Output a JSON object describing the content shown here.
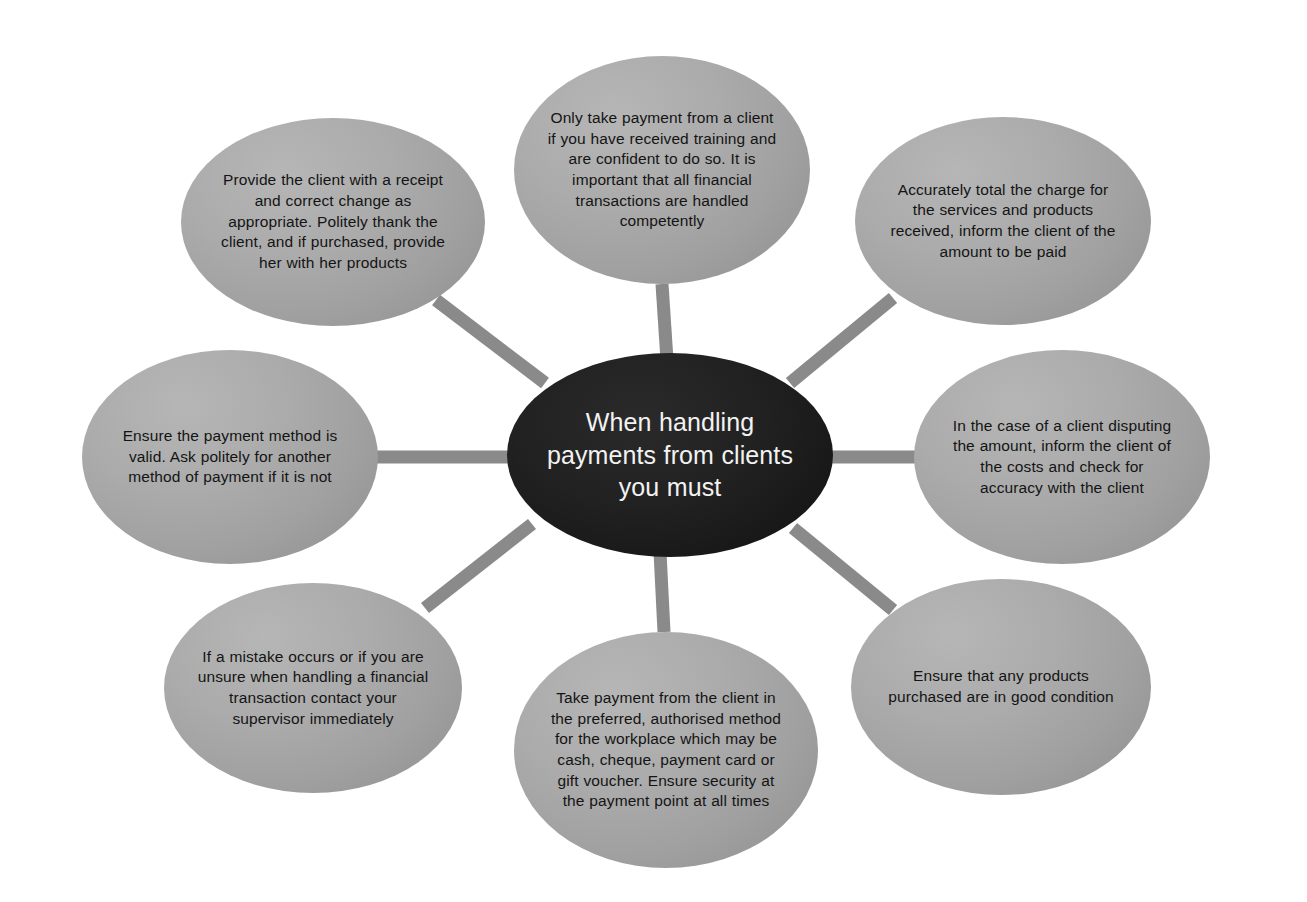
{
  "diagram": {
    "type": "hub-and-spoke",
    "title": "When handling payments from clients you must",
    "background_color": "#ffffff",
    "hub_color": "#1c1c1c",
    "hub_text_color": "#f2f2f2",
    "satellite_color": "#a5a5a5",
    "satellite_text_color": "#141414",
    "spoke_color": "#8a8a8a",
    "spoke_width_px": 13,
    "satellite_count": 8,
    "hub": {
      "label": "When handling payments from clients you must",
      "cx": 670,
      "cy": 455,
      "rx": 163,
      "ry": 102
    },
    "nodes": [
      {
        "id": "top",
        "position": "top",
        "label": "Only take payment from a client if you have received training and are confident to do so. It is important that all financial transactions are handled competently",
        "cx": 662,
        "cy": 170,
        "rx": 148,
        "ry": 114,
        "spoke": {
          "x1": 662,
          "y1": 284,
          "x2": 667,
          "y2": 360
        }
      },
      {
        "id": "top-right",
        "position": "top-right",
        "label": "Accurately total the charge for the services and products received, inform the client of the amount to be paid",
        "cx": 1003,
        "cy": 221,
        "rx": 148,
        "ry": 104,
        "spoke": {
          "x1": 893,
          "y1": 298,
          "x2": 790,
          "y2": 383
        }
      },
      {
        "id": "right",
        "position": "right",
        "label": "In the case of a client disputing the amount, inform the client of the costs and check for accuracy with the client",
        "cx": 1062,
        "cy": 457,
        "rx": 148,
        "ry": 107,
        "spoke": {
          "x1": 916,
          "y1": 457,
          "x2": 828,
          "y2": 457
        }
      },
      {
        "id": "bottom-right",
        "position": "bottom-right",
        "label": "Ensure that any products purchased are in good condition",
        "cx": 1001,
        "cy": 687,
        "rx": 150,
        "ry": 108,
        "spoke": {
          "x1": 893,
          "y1": 610,
          "x2": 793,
          "y2": 528
        }
      },
      {
        "id": "bottom",
        "position": "bottom",
        "label": "Take payment from the client in the preferred, authorised method for the workplace which may be cash, cheque, payment card or gift voucher. Ensure security at the payment point at all times",
        "cx": 666,
        "cy": 750,
        "rx": 152,
        "ry": 118,
        "spoke": {
          "x1": 664,
          "y1": 632,
          "x2": 660,
          "y2": 552
        }
      },
      {
        "id": "bottom-left",
        "position": "bottom-left",
        "label": "If a mistake occurs or if you are unsure when handling a financial transaction contact your supervisor immediately",
        "cx": 313,
        "cy": 688,
        "rx": 149,
        "ry": 105,
        "spoke": {
          "x1": 425,
          "y1": 608,
          "x2": 532,
          "y2": 524
        }
      },
      {
        "id": "left",
        "position": "left",
        "label": "Ensure the payment method is valid. Ask politely for another method of payment if it is not",
        "cx": 230,
        "cy": 457,
        "rx": 148,
        "ry": 107,
        "spoke": {
          "x1": 374,
          "y1": 457,
          "x2": 512,
          "y2": 457
        }
      },
      {
        "id": "top-left",
        "position": "top-left",
        "label": "Provide the client with a receipt and correct change as appropriate. Politely thank the client, and if purchased, provide her with her products",
        "cx": 333,
        "cy": 222,
        "rx": 152,
        "ry": 104,
        "spoke": {
          "x1": 436,
          "y1": 300,
          "x2": 545,
          "y2": 383
        }
      }
    ]
  }
}
